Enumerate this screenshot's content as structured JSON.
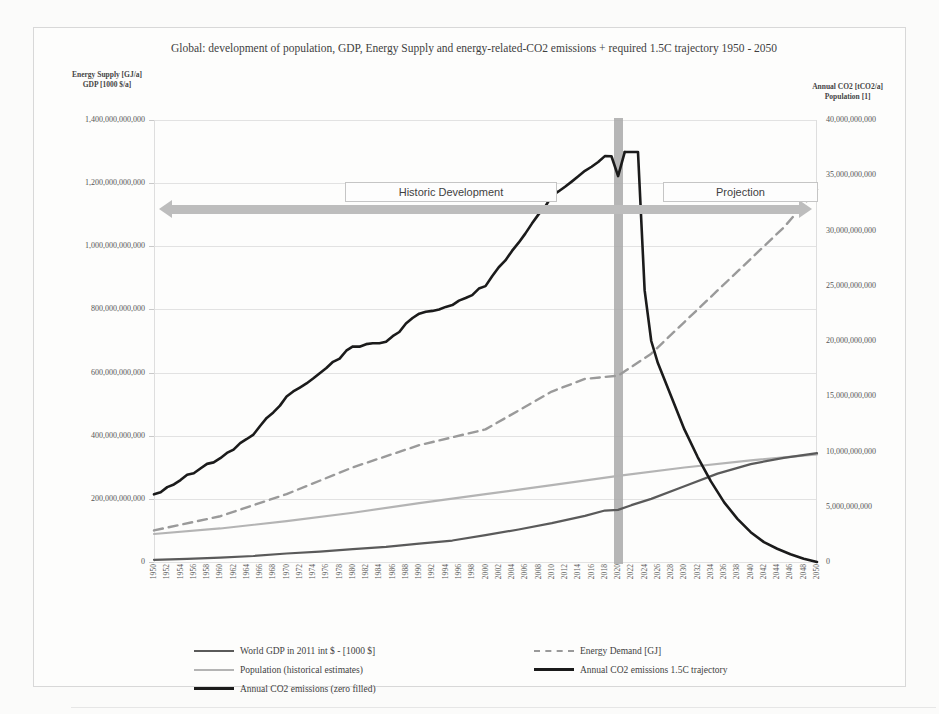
{
  "chart_data": {
    "type": "line",
    "title": "Global: development of population, GDP, Energy Supply and energy-related-CO2 emissions + required 1.5C trajectory 1950 - 2050",
    "left_axis_label_line1": "Energy Supply [GJ/a]",
    "left_axis_label_line2": "GDP [1000 $/a]",
    "right_axis_label_line1": "Annual CO2 [tCO2/a]",
    "right_axis_label_line2": "Population [1]",
    "xlabel": "",
    "grid": true,
    "legend_position": "bottom",
    "xlim": [
      1950,
      2050
    ],
    "left_ylim": [
      0,
      1400000000000
    ],
    "right_ylim": [
      0,
      40000000000
    ],
    "left_yticks": [
      "0",
      "200,000,000,000",
      "400,000,000,000",
      "600,000,000,000",
      "800,000,000,000",
      "1,000,000,000,000",
      "1,200,000,000,000",
      "1,400,000,000,000"
    ],
    "right_yticks": [
      "0",
      "5,000,000,000",
      "10,000,000,000",
      "15,000,000,000",
      "20,000,000,000",
      "25,000,000,000",
      "30,000,000,000",
      "35,000,000,000",
      "40,000,000,000"
    ],
    "xticks": [
      "1950",
      "1952",
      "1954",
      "1956",
      "1958",
      "1960",
      "1962",
      "1964",
      "1966",
      "1968",
      "1970",
      "1972",
      "1974",
      "1976",
      "1978",
      "1980",
      "1982",
      "1984",
      "1986",
      "1988",
      "1990",
      "1992",
      "1994",
      "1996",
      "1998",
      "2000",
      "2002",
      "2004",
      "2006",
      "2008",
      "2010",
      "2012",
      "2014",
      "2016",
      "2018",
      "2020",
      "2022",
      "2024",
      "2026",
      "2028",
      "2030",
      "2032",
      "2034",
      "2036",
      "2038",
      "2040",
      "2042",
      "2044",
      "2046",
      "2048",
      "2050"
    ],
    "annotations": {
      "historic_label": "Historic Development",
      "projection_label": "Projection",
      "divider_year": "2020"
    },
    "colors": {
      "gdp": "#5a5a5a",
      "population": "#b4b4b4",
      "co2": "#1b1b1b",
      "energy_demand": "#9a9a9a",
      "co2_trajectory": "#1b1b1b",
      "grid": "#e2e2e2",
      "arrow": "#bdbdbd",
      "covid_band": "#a9a9a9"
    },
    "series": [
      {
        "name": "World GDP in 2011 int $ - [1000 $]",
        "axis": "left",
        "style": "solid",
        "color": "#5a5a5a",
        "x": [
          1950,
          1955,
          1960,
          1965,
          1970,
          1975,
          1980,
          1985,
          1990,
          1995,
          2000,
          2005,
          2010,
          2015,
          2018,
          2020,
          2022,
          2025,
          2030,
          2035,
          2040,
          2045,
          2050
        ],
        "values": [
          7000000000,
          10000000000,
          14000000000,
          19000000000,
          27000000000,
          33000000000,
          41000000000,
          48000000000,
          58000000000,
          68000000000,
          85000000000,
          103000000000,
          123000000000,
          146000000000,
          163000000000,
          165000000000,
          180000000000,
          200000000000,
          240000000000,
          280000000000,
          310000000000,
          330000000000,
          345000000000
        ]
      },
      {
        "name": "Population (historical estimates)",
        "axis": "right",
        "style": "solid",
        "color": "#b4b4b4",
        "x": [
          1950,
          1960,
          1970,
          1980,
          1990,
          2000,
          2010,
          2020,
          2030,
          2040,
          2050
        ],
        "values": [
          2536000000,
          3034000000,
          3700000000,
          4458000000,
          5327000000,
          6143000000,
          6957000000,
          7795000000,
          8550000000,
          9200000000,
          9735000000
        ]
      },
      {
        "name": "Annual CO2 emissions (zero filled)",
        "axis": "right",
        "style": "solid",
        "color": "#1b1b1b",
        "x": [
          1950,
          1955,
          1960,
          1965,
          1970,
          1975,
          1980,
          1985,
          1990,
          1995,
          2000,
          2005,
          2010,
          2015,
          2018,
          2019,
          2020,
          2021
        ],
        "values": [
          6000000000,
          7800000000,
          9400000000,
          11600000000,
          14900000000,
          17000000000,
          19500000000,
          19800000000,
          22600000000,
          23200000000,
          25000000000,
          29000000000,
          33100000000,
          35300000000,
          36600000000,
          36700000000,
          34800000000,
          37100000000
        ]
      },
      {
        "name": "Energy Demand [GJ]",
        "axis": "left",
        "style": "dashed",
        "color": "#9a9a9a",
        "x": [
          1950,
          1960,
          1970,
          1980,
          1990,
          2000,
          2005,
          2010,
          2015,
          2020,
          2025,
          2030,
          2035,
          2040,
          2045,
          2050
        ],
        "values": [
          100000000000,
          145000000000,
          215000000000,
          300000000000,
          370000000000,
          420000000000,
          480000000000,
          540000000000,
          580000000000,
          590000000000,
          660000000000,
          760000000000,
          860000000000,
          960000000000,
          1060000000000,
          1180000000000
        ]
      },
      {
        "name": "Annual CO2 emissions 1.5C trajectory",
        "axis": "right",
        "style": "solid",
        "color": "#1b1b1b",
        "x": [
          2021,
          2022,
          2023,
          2024,
          2025,
          2026,
          2028,
          2030,
          2032,
          2034,
          2036,
          2038,
          2040,
          2042,
          2044,
          2046,
          2048,
          2050
        ],
        "values": [
          37100000000,
          37100000000,
          37100000000,
          24600000000,
          20000000000,
          18000000000,
          15000000000,
          12000000000,
          9500000000,
          7300000000,
          5400000000,
          3900000000,
          2700000000,
          1800000000,
          1200000000,
          700000000,
          300000000,
          0
        ]
      }
    ]
  },
  "legend": {
    "items": [
      {
        "label": "World GDP in 2011 int $ - [1000 $]",
        "swatch": "sw-gdp"
      },
      {
        "label": "Population (historical estimates)",
        "swatch": "sw-pop"
      },
      {
        "label": "Annual CO2 emissions (zero filled)",
        "swatch": "sw-co2"
      },
      {
        "label": "Energy Demand [GJ]",
        "swatch": "sw-energy"
      },
      {
        "label": "Annual CO2 emissions 1.5C trajectory",
        "swatch": "sw-traj"
      }
    ]
  }
}
